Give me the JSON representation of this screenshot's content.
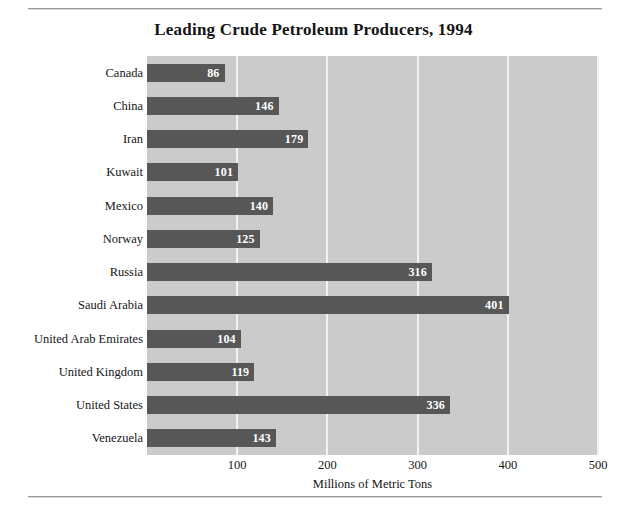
{
  "chart_data": {
    "type": "bar",
    "orientation": "horizontal",
    "title": "Leading Crude Petroleum Producers, 1994",
    "xlabel": "Millions of Metric Tons",
    "ylabel": "",
    "xlim": [
      0,
      500
    ],
    "xticks": [
      100,
      200,
      300,
      400,
      500
    ],
    "grid": true,
    "legend": false,
    "categories": [
      "Canada",
      "China",
      "Iran",
      "Kuwait",
      "Mexico",
      "Norway",
      "Russia",
      "Saudi Arabia",
      "United Arab Emirates",
      "United Kingdom",
      "United States",
      "Venezuela"
    ],
    "values": [
      86,
      146,
      179,
      101,
      140,
      125,
      316,
      401,
      104,
      119,
      336,
      143
    ],
    "value_labels": [
      "86",
      "146",
      "179",
      "101",
      "140",
      "125",
      "316",
      "401",
      "104",
      "119",
      "336",
      "143"
    ]
  },
  "style": {
    "bar_color": "#575757",
    "plot_background": "#cbcbcb",
    "gridline_color": "#f2f2f2",
    "value_label_color": "#ffffff",
    "text_color": "#151515",
    "rule_color": "#9a9a9a"
  }
}
